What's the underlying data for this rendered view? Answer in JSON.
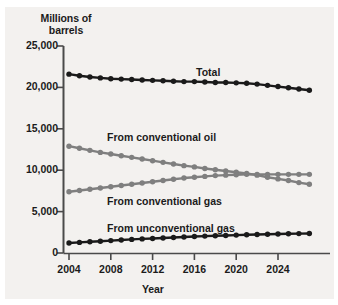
{
  "chart_data": {
    "type": "line",
    "title": "",
    "xlabel": "Year",
    "ylabel_line1": "Millions of",
    "ylabel_line2": "barrels",
    "ylabel": "Millions of barrels",
    "grid": false,
    "legend_position": "inline-annotations",
    "xlim": [
      2004,
      2027
    ],
    "ylim": [
      0,
      25000
    ],
    "ytick_labels": [
      "25,000",
      "20,000",
      "15,000",
      "10,000",
      "5,000",
      "0"
    ],
    "ytick_values": [
      25000,
      20000,
      15000,
      10000,
      5000,
      0
    ],
    "xtick_labels": [
      "2004",
      "2008",
      "2012",
      "2016",
      "2020",
      "2024"
    ],
    "xtick_values": [
      2004,
      2008,
      2012,
      2016,
      2020,
      2024
    ],
    "x": [
      2004,
      2005,
      2006,
      2007,
      2008,
      2009,
      2010,
      2011,
      2012,
      2013,
      2014,
      2015,
      2016,
      2017,
      2018,
      2019,
      2020,
      2021,
      2022,
      2023,
      2024,
      2025,
      2026,
      2027
    ],
    "series": [
      {
        "name": "Total",
        "color": "#1a1a1a",
        "label": "Total",
        "values": [
          21600,
          21400,
          21250,
          21150,
          21050,
          21000,
          20950,
          20900,
          20850,
          20800,
          20750,
          20700,
          20700,
          20650,
          20600,
          20600,
          20550,
          20500,
          20400,
          20250,
          20100,
          19950,
          19800,
          19650
        ]
      },
      {
        "name": "From conventional oil",
        "color": "#7f7f7f",
        "label": "From conventional oil",
        "values": [
          12900,
          12650,
          12400,
          12150,
          11950,
          11750,
          11550,
          11350,
          11150,
          10950,
          10750,
          10550,
          10400,
          10200,
          10050,
          9900,
          9750,
          9600,
          9400,
          9150,
          8950,
          8750,
          8500,
          8300
        ]
      },
      {
        "name": "From conventional gas",
        "color": "#7f7f7f",
        "label": "From conventional gas",
        "values": [
          7400,
          7550,
          7700,
          7850,
          8000,
          8150,
          8300,
          8450,
          8600,
          8750,
          8900,
          9050,
          9150,
          9250,
          9350,
          9400,
          9450,
          9500,
          9500,
          9500,
          9500,
          9500,
          9500,
          9500
        ]
      },
      {
        "name": "From unconventional gas",
        "color": "#1a1a1a",
        "label": "From unconventional gas",
        "values": [
          1200,
          1280,
          1350,
          1420,
          1500,
          1570,
          1640,
          1700,
          1760,
          1820,
          1880,
          1940,
          1990,
          2040,
          2080,
          2120,
          2160,
          2200,
          2230,
          2260,
          2290,
          2320,
          2340,
          2360
        ]
      }
    ],
    "annotations": [
      {
        "text": "Total",
        "x_px": 196,
        "y_px": 66
      },
      {
        "text": "From conventional oil",
        "x_px": 107,
        "y_px": 131
      },
      {
        "text": "From conventional gas",
        "x_px": 107,
        "y_px": 195
      },
      {
        "text": "From unconventional gas",
        "x_px": 107,
        "y_px": 222
      }
    ],
    "colors": {
      "background": "#f3f1ef",
      "axis": "#4a4a4a",
      "text": "#1b1b1b",
      "dark_series": "#1a1a1a",
      "gray_series": "#7f7f7f"
    }
  }
}
